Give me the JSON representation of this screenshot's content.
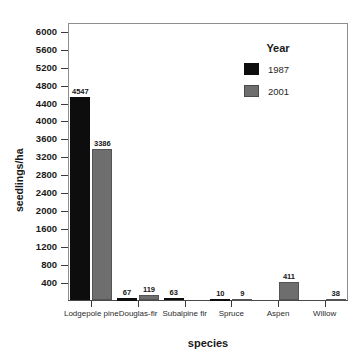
{
  "chart_data": {
    "type": "bar",
    "title": "",
    "xlabel": "species",
    "ylabel": "seedlings/ha",
    "categories": [
      "Lodgepole pine",
      "Douglas-fir",
      "Subalpine fir",
      "Spruce",
      "Aspen",
      "Willow"
    ],
    "series": [
      {
        "name": "1987",
        "color": "#0d0d0d",
        "values": [
          4547,
          67,
          63,
          10,
          0,
          0
        ],
        "labels": [
          "4547",
          "67",
          "63",
          "10",
          "",
          ""
        ]
      },
      {
        "name": "2001",
        "color": "#6e6e6e",
        "values": [
          3386,
          119,
          0,
          9,
          411,
          38
        ],
        "labels": [
          "3386",
          "119",
          "",
          "9",
          "411",
          "38"
        ]
      }
    ],
    "ylim": [
      0,
      6200
    ],
    "yticks": [
      400,
      800,
      1200,
      1600,
      2000,
      2400,
      2800,
      3200,
      3600,
      4000,
      4400,
      4800,
      5200,
      5600,
      6000
    ],
    "ytick_labels": [
      "400",
      "800",
      "1200",
      "1600",
      "2000",
      "2400",
      "2800",
      "3200",
      "3600",
      "4000",
      "4400",
      "4800",
      "5200",
      "5600",
      "6000"
    ],
    "grid": false,
    "legend": {
      "title": "Year",
      "position": "top-right",
      "entries": [
        {
          "label": "1987",
          "color": "#0d0d0d"
        },
        {
          "label": "2001",
          "color": "#6e6e6e"
        }
      ]
    }
  }
}
